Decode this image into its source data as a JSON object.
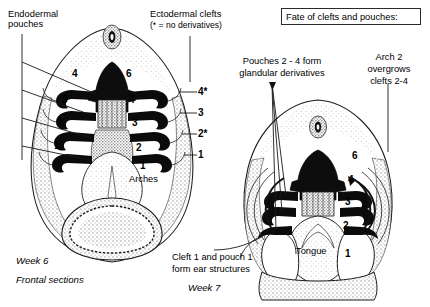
{
  "figure": {
    "title_box": "Fate of clefts and pouches:",
    "left_panel": {
      "caption_line1": "Week 6",
      "caption_line2": "Frontal sections",
      "annotations": {
        "endodermal_pouches": "Endodermal\npouches",
        "ectodermal_clefts_line1": "Ectodermal clefts",
        "ectodermal_clefts_line2": "(* = no derivatives)",
        "arches": "Arches"
      },
      "pouch_numbers": [
        "4",
        "3",
        "2",
        "1"
      ],
      "arch_numbers": [
        "6",
        "4",
        "3",
        "2",
        "1"
      ],
      "cleft_numbers": [
        "4*",
        "3",
        "2*",
        "1"
      ]
    },
    "right_panel": {
      "caption_line1": "Week 7",
      "annotations": {
        "pouches_line1": "Pouches 2 - 4 form",
        "pouches_line2": "glandular derivatives",
        "arch2_line1": "Arch 2",
        "arch2_line2": "overgrows",
        "arch2_line3": "clefts 2-4",
        "ear_line1": "Cleft 1 and pouch 1",
        "ear_line2": "form ear structures",
        "tongue": "Tongue"
      },
      "arch_numbers": [
        "6",
        "4",
        "3",
        "2",
        "1"
      ]
    },
    "colors": {
      "ink": "#000000",
      "background": "#ffffff",
      "stipple": "#b9b9b9",
      "stipple_light": "#dcdcdc"
    }
  }
}
